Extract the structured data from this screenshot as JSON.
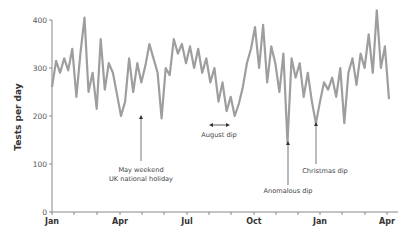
{
  "chart_data": {
    "type": "line",
    "title": "",
    "xlabel": "",
    "ylabel": "Tests per day",
    "ylim": [
      0,
      400
    ],
    "yticks": [
      0,
      100,
      200,
      300,
      400
    ],
    "xtick_labels": [
      "Jan",
      "Apr",
      "Jul",
      "Oct",
      "Jan",
      "Apr"
    ],
    "grid": false,
    "legend": null,
    "line_color": "#9e9e9e",
    "series": [
      {
        "name": "Tests per day",
        "x_unit": "week index from Jan (approx.)",
        "values": [
          260,
          315,
          290,
          320,
          295,
          340,
          240,
          330,
          405,
          250,
          290,
          215,
          360,
          255,
          310,
          290,
          245,
          200,
          230,
          320,
          250,
          310,
          270,
          305,
          350,
          320,
          290,
          195,
          300,
          285,
          360,
          330,
          350,
          310,
          345,
          300,
          340,
          290,
          320,
          270,
          300,
          230,
          270,
          210,
          240,
          200,
          225,
          260,
          310,
          340,
          385,
          300,
          390,
          270,
          345,
          310,
          250,
          330,
          145,
          320,
          280,
          310,
          240,
          290,
          230,
          185,
          230,
          270,
          255,
          280,
          240,
          300,
          185,
          290,
          320,
          265,
          330,
          300,
          370,
          290,
          420,
          300,
          345,
          235
        ]
      }
    ],
    "annotations": [
      {
        "label": "May weekend\nUK national holiday",
        "month": "May",
        "value": 195
      },
      {
        "label": "August dip",
        "month": "Aug",
        "value": 200,
        "kind": "double-arrow"
      },
      {
        "label": "Anomalous dip",
        "month": "Nov",
        "value": 145
      },
      {
        "label": "Christmas dip",
        "month": "Dec/Jan",
        "value": 185
      }
    ]
  },
  "axis": {
    "ylabel": "Tests per day",
    "yticks": [
      "0",
      "100",
      "200",
      "300",
      "400"
    ],
    "months": [
      "Jan",
      "Apr",
      "Jul",
      "Oct",
      "Jan",
      "Apr"
    ]
  },
  "annotations": {
    "may_line1": "May weekend",
    "may_line2": "UK national holiday",
    "august": "August dip",
    "anomalous": "Anomalous dip",
    "christmas": "Christmas dip"
  }
}
